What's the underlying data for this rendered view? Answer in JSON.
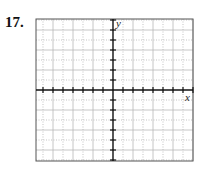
{
  "problem": {
    "number": "17."
  },
  "chart_data": {
    "type": "scatter",
    "title": "",
    "xlabel": "x",
    "ylabel": "y",
    "series": [],
    "grid": true,
    "xlim": [
      -7.7,
      8
    ],
    "ylim": [
      -7.1,
      7.1
    ],
    "major_grid_step": 2,
    "minor_grid_step": 1,
    "tick_step": 1
  },
  "axes": {
    "x_label": "x",
    "y_label": "y"
  }
}
